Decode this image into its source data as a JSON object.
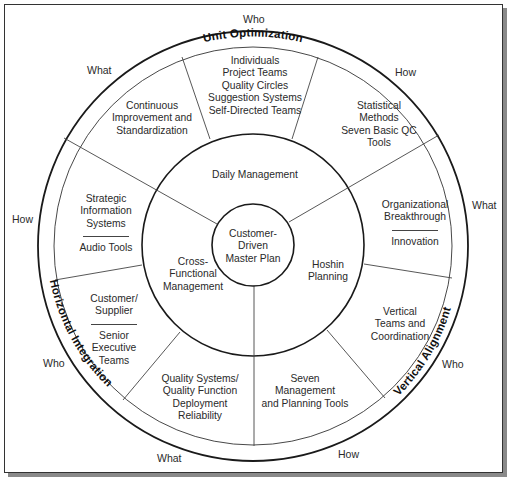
{
  "diagram": {
    "type": "concentric-wheel",
    "center": {
      "lines": [
        "Customer-",
        "Driven",
        "Master Plan"
      ]
    },
    "middle_ring": [
      {
        "id": "daily",
        "label": "Daily Management"
      },
      {
        "id": "cross",
        "lines": [
          "Cross-",
          "Functional",
          "Management"
        ]
      },
      {
        "id": "hoshin",
        "lines": [
          "Hoshin",
          "Planning"
        ]
      }
    ],
    "outer_sectors": [
      {
        "id": "top",
        "lines": [
          "Individuals",
          "Project Teams",
          "Quality Circles",
          "Suggestion Systems",
          "Self-Directed Teams"
        ]
      },
      {
        "id": "top-left",
        "lines": [
          "Continuous",
          "Improvement and",
          "Standardization"
        ]
      },
      {
        "id": "top-right",
        "lines": [
          "Statistical",
          "Methods",
          "Seven Basic QC",
          "Tools"
        ]
      },
      {
        "id": "left",
        "lines": [
          "Strategic",
          "Information",
          "Systems"
        ],
        "lines2": [
          "Audio Tools"
        ]
      },
      {
        "id": "right",
        "lines": [
          "Organizational",
          "Breakthrough"
        ],
        "lines2": [
          "Innovation"
        ]
      },
      {
        "id": "left-lower",
        "lines": [
          "Customer/",
          "Supplier"
        ],
        "lines2": [
          "Senior",
          "Executive",
          "Teams"
        ]
      },
      {
        "id": "right-lower",
        "lines": [
          "Vertical",
          "Teams and",
          "Coordination"
        ]
      },
      {
        "id": "bottom-left",
        "lines": [
          "Quality Systems/",
          "Quality Function",
          "Deployment",
          "Reliability"
        ]
      },
      {
        "id": "bottom-right",
        "lines": [
          "Seven",
          "Management",
          "and Planning Tools"
        ]
      }
    ],
    "ring_titles": {
      "top": "Unit Optimization",
      "left": "Horizontal Integration",
      "right": "Vertical Alignment"
    },
    "outside_labels": {
      "top": "Who",
      "top_left": "What",
      "top_right": "How",
      "left": "How",
      "right": "What",
      "left_lower": "Who",
      "right_lower": "Who",
      "bottom_left": "What",
      "bottom_right": "How"
    }
  }
}
